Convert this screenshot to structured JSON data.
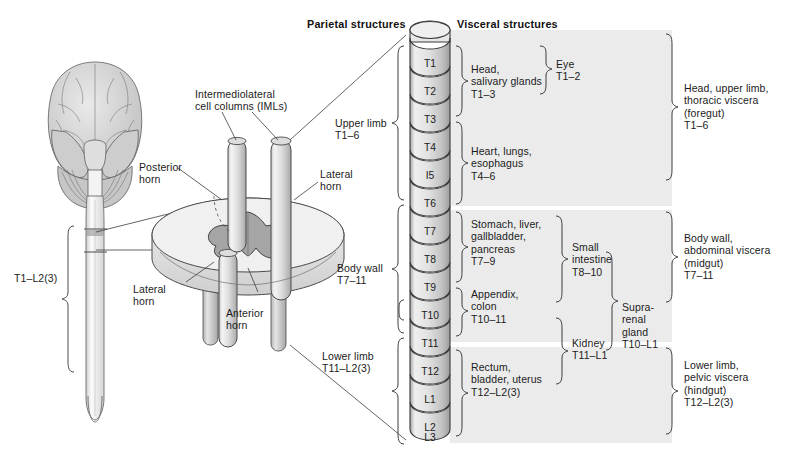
{
  "figure": {
    "title_columns": {
      "parietal": "Parietal structures",
      "visceral": "Visceral structures"
    },
    "colors": {
      "band_fill": "#ebebeb",
      "segment_fill_light": "#f0f0f0",
      "segment_fill_dark": "#b9b9b9",
      "outline": "#3a3a3a",
      "text": "#1b1b1b",
      "brain_fill": "#d6d6d6",
      "cord_fill": "#efefef"
    }
  },
  "left_illustration": {
    "labels": [
      {
        "name": "iml-label",
        "text": "Intermediolateral\ncell columns (IMLs)"
      },
      {
        "name": "posterior-horn-label",
        "text": "Posterior\nhorn"
      },
      {
        "name": "lateral-horn-label-right",
        "text": "Lateral\nhorn"
      },
      {
        "name": "lateral-horn-label-lower",
        "text": "Lateral\nhorn"
      },
      {
        "name": "anterior-horn-label",
        "text": "Anterior\nhorn"
      },
      {
        "name": "cord-extent-label",
        "text": "T1–L2(3)"
      }
    ]
  },
  "spinal_segments": {
    "labels": [
      "T1",
      "T2",
      "T3",
      "T4",
      "I5",
      "T6",
      "T7",
      "T8",
      "T9",
      "T10",
      "T11",
      "T12",
      "L1",
      "L2",
      "L3"
    ],
    "shown": [
      "T1",
      "T2",
      "T3",
      "T4",
      "I5",
      "T6",
      "T7",
      "T8",
      "T9",
      "T10",
      "T11",
      "T12",
      "L1",
      "L2",
      "L3"
    ]
  },
  "parietal_groups": [
    {
      "name": "upper-limb",
      "text": "Upper limb\nT1–6"
    },
    {
      "name": "body-wall",
      "text": "Body wall\nT7–11"
    },
    {
      "name": "lower-limb",
      "text": "Lower limb\nT11–L2(3)"
    }
  ],
  "visceral_column_1": [
    {
      "name": "head-salivary",
      "text": "Head,\nsalivary glands\nT1–3"
    },
    {
      "name": "heart-lungs-esophagus",
      "text": "Heart, lungs,\nesophagus\nT4–6"
    },
    {
      "name": "stomach-liver-gallbladder-pancreas",
      "text": "Stomach, liver,\ngallbladder,\npancreas\nT7–9"
    },
    {
      "name": "appendix-colon",
      "text": "Appendix,\ncolon\nT10–11"
    },
    {
      "name": "rectum-bladder-uterus",
      "text": "Rectum,\nbladder, uterus\nT12–L2(3)"
    }
  ],
  "visceral_column_2": [
    {
      "name": "eye",
      "text": "Eye\nT1–2"
    },
    {
      "name": "small-intestine",
      "text": "Small\nintestine\nT8–10"
    },
    {
      "name": "kidney",
      "text": "Kidney\nT11–L1"
    }
  ],
  "visceral_column_3": [
    {
      "name": "suprarenal-gland",
      "text": "Supra-\nrenal\ngland\nT10–L1"
    }
  ],
  "summary_column": [
    {
      "name": "foregut-summary",
      "text": "Head, upper limb,\nthoracic viscera\n(foregut)\nT1–6"
    },
    {
      "name": "midgut-summary",
      "text": "Body wall,\nabdominal viscera\n(midgut)\nT7–11"
    },
    {
      "name": "hindgut-summary",
      "text": "Lower limb,\npelvic viscera\n(hindgut)\nT12–L2(3)"
    }
  ]
}
